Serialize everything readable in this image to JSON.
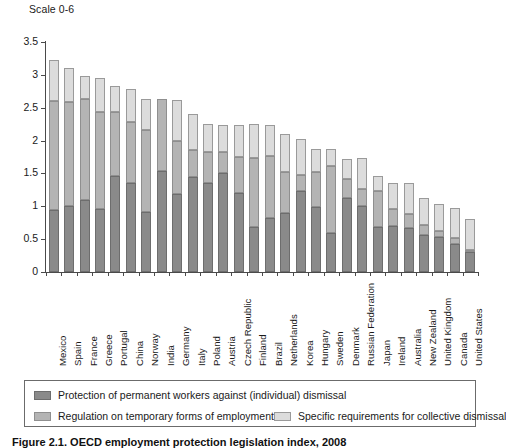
{
  "scale_note": "Scale 0-6",
  "caption": "Figure 2.1. OECD employment protection legislation index, 2008",
  "legend": {
    "items": [
      {
        "key": "s0",
        "label": "Protection of permanent workers against (individual) dismissal",
        "color": "#8a8a8a"
      },
      {
        "key": "s1",
        "label": "Regulation on temporary forms of employment",
        "color": "#b4b4b4"
      },
      {
        "key": "s2",
        "label": "Specific requirements for collective dismissal",
        "color": "#dcdcdc"
      }
    ]
  },
  "chart_data": {
    "type": "bar",
    "stacked": true,
    "title": "",
    "subtitle": "Scale 0-6",
    "xlabel": "",
    "ylabel": "",
    "ylim": [
      0,
      3.5
    ],
    "yticks": [
      0,
      0.5,
      1,
      1.5,
      2,
      2.5,
      3,
      3.5
    ],
    "ytick_labels": [
      "0",
      "0.5",
      "1",
      "1.5",
      "2",
      "2.5",
      "3",
      "3.5"
    ],
    "grid": false,
    "legend_position": "bottom",
    "categories": [
      "Mexico",
      "Spain",
      "France",
      "Greece",
      "Portugal",
      "China",
      "Norway",
      "India",
      "Germany",
      "Italy",
      "Poland",
      "Austria",
      "Czech Republic",
      "Finland",
      "Brazil",
      "Netherlands",
      "Korea",
      "Hungary",
      "Sweden",
      "Denmark",
      "Russian Federation",
      "Japan",
      "Ireland",
      "Australia",
      "New Zealand",
      "United Kingdom",
      "Canada",
      "United States"
    ],
    "series": [
      {
        "name": "Protection of permanent workers against (individual) dismissal",
        "color": "#8a8a8a",
        "values": [
          0.94,
          1.0,
          1.09,
          0.96,
          1.46,
          1.36,
          0.91,
          1.53,
          1.18,
          1.45,
          1.36,
          1.51,
          1.2,
          0.69,
          0.82,
          0.9,
          1.24,
          0.99,
          0.59,
          1.13,
          1.0,
          0.68,
          0.7,
          0.67,
          0.57,
          0.54,
          0.43,
          0.3
        ]
      },
      {
        "name": "Regulation on temporary forms of employment",
        "color": "#b4b4b4",
        "values": [
          1.66,
          1.58,
          1.55,
          1.47,
          0.98,
          0.92,
          1.25,
          1.11,
          0.82,
          0.41,
          0.46,
          0.31,
          0.55,
          1.04,
          0.94,
          0.62,
          0.24,
          0.53,
          1.03,
          0.28,
          0.26,
          0.56,
          0.26,
          0.22,
          0.15,
          0.09,
          0.09,
          0.03
        ]
      },
      {
        "name": "Specific requirements for collective dismissal",
        "color": "#dcdcdc",
        "values": [
          0.63,
          0.52,
          0.35,
          0.53,
          0.39,
          0.51,
          0.48,
          0.0,
          0.62,
          0.54,
          0.43,
          0.42,
          0.49,
          0.52,
          0.48,
          0.58,
          0.54,
          0.35,
          0.25,
          0.31,
          0.48,
          0.22,
          0.4,
          0.47,
          0.4,
          0.4,
          0.46,
          0.48
        ]
      }
    ]
  }
}
